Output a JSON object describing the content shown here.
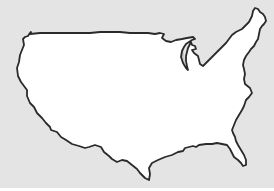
{
  "map": {
    "title": "",
    "subject": "Alaska overlaid on contiguous United States (size comparison)",
    "regions": [
      {
        "name": "Contiguous United States",
        "fill": "#ffffff",
        "stroke": "#2a2a2a"
      },
      {
        "name": "Alaska",
        "fill": "#c9c9c9",
        "stroke": "none"
      }
    ],
    "colors": {
      "background": "#e4e4e4",
      "land": "#ffffff",
      "outline": "#2a2a2a",
      "alaska": "#c9c9c9"
    }
  }
}
